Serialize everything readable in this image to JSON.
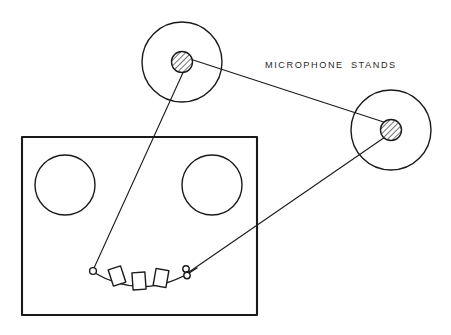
{
  "diagram": {
    "background_color": "#ffffff",
    "line_color": "#1a1a1a",
    "canvas": {
      "width": 451,
      "height": 335
    },
    "annotations": [
      {
        "id": "microphone-stands-label",
        "text": "MICROPHONE STANDS",
        "x": 265,
        "y": 68
      }
    ],
    "platform": {
      "name": "stage-platform",
      "x": 22,
      "y": 137,
      "width": 235,
      "height": 178
    },
    "platform_circles": [
      {
        "name": "platform-circle-left",
        "cx": 65,
        "cy": 185,
        "r": 30
      },
      {
        "name": "platform-circle-right",
        "cx": 212,
        "cy": 185,
        "r": 30
      }
    ],
    "arc": {
      "name": "curved-footlight-rail",
      "path": "M 93 272 Q 145 303 197 268"
    },
    "arc_rectangles": [
      {
        "name": "arc-rect-1",
        "cx": 117,
        "cy": 276,
        "w": 13,
        "h": 17,
        "rotate": -18
      },
      {
        "name": "arc-rect-2",
        "cx": 139,
        "cy": 281,
        "w": 13,
        "h": 17,
        "rotate": -4
      },
      {
        "name": "arc-rect-3",
        "cx": 161,
        "cy": 278,
        "w": 13,
        "h": 17,
        "rotate": 10
      }
    ],
    "arc_end_markers": [
      {
        "name": "arc-marker-left",
        "cx": 93,
        "cy": 271,
        "r": 3.4
      },
      {
        "name": "arc-marker-right-upper",
        "cx": 186,
        "cy": 269,
        "r": 3.2
      },
      {
        "name": "arc-marker-right-lower",
        "cx": 187,
        "cy": 275,
        "r": 3.2
      }
    ],
    "microphone_stands": [
      {
        "name": "microphone-stand-top",
        "base_cx": 182,
        "base_cy": 62,
        "base_r": 40,
        "pole_cx": 182,
        "pole_cy": 62,
        "pole_r": 10.5
      },
      {
        "name": "microphone-stand-right",
        "base_cx": 391,
        "base_cy": 130,
        "base_r": 40,
        "pole_cx": 391,
        "pole_cy": 130,
        "pole_r": 10.5
      }
    ],
    "leader_lines": [
      {
        "name": "leader-top-stand-to-arc-left",
        "x1": 186,
        "y1": 66,
        "x2": 94,
        "y2": 268
      },
      {
        "name": "leader-top-stand-to-right-stand",
        "x1": 187,
        "y1": 58,
        "x2": 396,
        "y2": 126
      },
      {
        "name": "leader-right-stand-to-arc-right",
        "x1": 388,
        "y1": 135,
        "x2": 189,
        "y2": 272
      }
    ]
  }
}
